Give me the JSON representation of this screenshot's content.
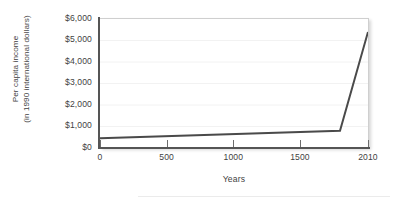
{
  "chart_data": {
    "type": "line",
    "title": "",
    "xlabel": "Years",
    "ylabel": "Per capita income (in 1990 international dollars)",
    "ylabel_lines": [
      "Per capita income",
      "(in 1990 international dollars)"
    ],
    "xlim": [
      0,
      2010
    ],
    "ylim": [
      0,
      6000
    ],
    "grid": true,
    "grid_axis": "y",
    "legend": null,
    "x_ticks": [
      0,
      500,
      1000,
      1500,
      2010
    ],
    "x_tick_labels": [
      "0",
      "500",
      "1000",
      "1500",
      "2010"
    ],
    "y_ticks": [
      0,
      1000,
      2000,
      3000,
      4000,
      5000,
      6000
    ],
    "y_tick_labels": [
      "$0",
      "$1,000",
      "$2,000",
      "$3,000",
      "$4,000",
      "$5,000",
      "$6,000"
    ],
    "series": [
      {
        "name": "Per capita income",
        "color": "#4a4a4a",
        "line_width": 2,
        "x": [
          0,
          1800,
          2010
        ],
        "values": [
          450,
          800,
          5400
        ]
      }
    ]
  },
  "colors": {
    "line": "#4a4a4a",
    "axis": "#555555",
    "grid": "#f2f2f2",
    "plot_border": "#cfcfcf",
    "text": "#3f3f3f",
    "background": "#ffffff"
  }
}
